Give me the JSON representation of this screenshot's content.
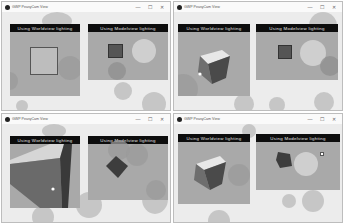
{
  "windows": [
    {
      "title": "GWP PeasyCam View",
      "controls": {
        "minimize": "—",
        "maximize": "☐",
        "close": "✕"
      },
      "panels": [
        {
          "label": "Using Worldview lighting"
        },
        {
          "label": "Using Modelview lighting"
        }
      ]
    },
    {
      "title": "GWP PeasyCam View",
      "controls": {
        "minimize": "—",
        "maximize": "☐",
        "close": "✕"
      },
      "panels": [
        {
          "label": "Using Worldview lighting"
        },
        {
          "label": "Using Modelview lighting"
        }
      ]
    },
    {
      "title": "GWP PeasyCam View",
      "controls": {
        "minimize": "—",
        "maximize": "☐",
        "close": "✕"
      },
      "panels": [
        {
          "label": "Using Worldview lighting"
        },
        {
          "label": "Using Modelview lighting"
        }
      ]
    },
    {
      "title": "GWP PeasyCam View",
      "controls": {
        "minimize": "—",
        "maximize": "☐",
        "close": "✕"
      },
      "panels": [
        {
          "label": "Using Worldview lighting"
        },
        {
          "label": "Using Modelview lighting"
        }
      ]
    }
  ],
  "colors": {
    "panel_bg": "#a9a9a9",
    "label_bg": "#0d0d0d",
    "label_text": "#e8e8e8",
    "bubble": "#b9b9b9"
  }
}
